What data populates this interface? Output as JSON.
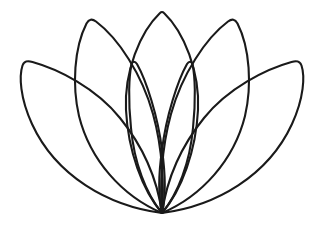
{
  "artwork": {
    "title": "Lotus Flower Outline",
    "subject": "lotus-flower",
    "style": "line-art",
    "background_color": "#ffffff",
    "stroke_color": "#1a1a1a",
    "stroke_width": 2.1,
    "canvas": {
      "width": 319,
      "height": 235
    },
    "origin": {
      "x": 162,
      "y": 213
    },
    "petal_count": 7,
    "symmetry": "bilateral-vertical",
    "petals": [
      {
        "name": "outer-left-petal",
        "layer": 1,
        "side": "left",
        "tip": {
          "x": 22,
          "y": 64
        },
        "d": "M 162 213 C 108 206 56 176 32 124 C 20 98 19 76 22.5 65.5 C 24 61 27 60.5 32.5 62 C 58 69 96 88 120 118 C 146 150 158 185 162 213 Z"
      },
      {
        "name": "outer-right-petal",
        "layer": 1,
        "side": "right",
        "tip": {
          "x": 300,
          "y": 64
        },
        "d": "M 162 213 C 216 206 268 176 292 124 C 304 98 305 76 301.5 65.5 C 300 61 297 60.5 291.5 62 C 266 69 228 88 204 118 C 178 150 166 185 162 213 Z"
      },
      {
        "name": "mid-left-petal",
        "layer": 2,
        "side": "left",
        "tip": {
          "x": 88,
          "y": 22
        },
        "d": "M 162 213 C 122 196 90 160 79 116 C 72 86 74 48 86.5 23.5 C 89 19 92 18.5 96 21.5 C 118 38 142 74 153 114 C 163 150 164 188 162 213 Z"
      },
      {
        "name": "mid-right-petal",
        "layer": 2,
        "side": "right",
        "tip": {
          "x": 236,
          "y": 22
        },
        "d": "M 162 213 C 202 196 234 160 245 116 C 252 86 250 48 237.5 23.5 C 235 19 232 18.5 228 21.5 C 206 38 182 74 171 114 C 161 150 160 188 162 213 Z"
      },
      {
        "name": "inner-left-petal",
        "layer": 3,
        "side": "left",
        "tip": {
          "x": 131,
          "y": 63
        },
        "d": "M 162 213 C 146 194 134 162 131 128 C 128 100 129 76 131.5 64.5 C 132.5 61 135 61 137 64 C 146 80 158 116 162 150 C 166 178 165 200 162 213 Z"
      },
      {
        "name": "inner-right-petal",
        "layer": 3,
        "side": "right",
        "tip": {
          "x": 193,
          "y": 63
        },
        "d": "M 162 213 C 178 194 190 162 193 128 C 196 100 195 76 192.5 64.5 C 191.5 61 189 61 187 64 C 178 80 166 116 162 150 C 158 178 159 200 162 213 Z"
      },
      {
        "name": "center-petal",
        "layer": 4,
        "side": "center",
        "tip": {
          "x": 162,
          "y": 11
        },
        "d": "M 162 213 C 142 190 128 150 126 110 C 124 72 140 32 160 13 C 161.3 11.6 162.7 11.6 164 13 C 184 32 200 72 198 110 C 196 150 182 190 162 213 Z"
      }
    ]
  }
}
